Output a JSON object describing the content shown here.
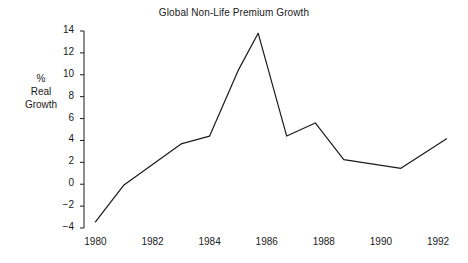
{
  "chart_data": {
    "type": "line",
    "title": "Global Non-Life Premium Growth",
    "xlabel": "",
    "ylabel": "% Real Growth",
    "ylabel_lines": [
      "%",
      "Real",
      "Growth"
    ],
    "xlim": [
      1979.6,
      1992.7
    ],
    "ylim": [
      -4,
      14
    ],
    "grid": false,
    "legend": null,
    "yticks": [
      14,
      12,
      10,
      8,
      6,
      4,
      2,
      0,
      -2,
      -4
    ],
    "ytick_labels": [
      "14",
      "12",
      "10",
      "8",
      "6",
      "4",
      "2",
      "0",
      "−2",
      "−4"
    ],
    "xticks": [
      1980,
      1982,
      1984,
      1986,
      1988,
      1990,
      1992
    ],
    "xtick_labels": [
      "1980",
      "1982",
      "1984",
      "1986",
      "1988",
      "1990",
      "1992"
    ],
    "line_color": "#1a1a1a",
    "series": [
      {
        "name": "Global Non-Life Premium Growth",
        "x": [
          1980.0,
          1981.0,
          1983.0,
          1984.0,
          1985.0,
          1985.7,
          1986.7,
          1987.7,
          1988.7,
          1990.7,
          1992.3
        ],
        "values": [
          -3.45,
          -0.07,
          3.68,
          4.4,
          10.4,
          13.8,
          4.4,
          5.6,
          2.25,
          1.45,
          4.15
        ]
      }
    ]
  }
}
